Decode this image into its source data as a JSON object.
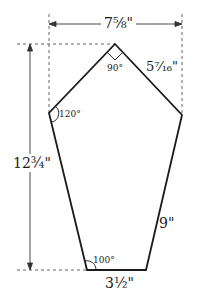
{
  "diagram": {
    "type": "pentagon-pattern",
    "colors": {
      "stroke": "#1a1a1a",
      "dim": "#333333",
      "background": "#ffffff"
    },
    "dimensions": {
      "width": "7⅝\"",
      "height": "12¾\""
    },
    "sides": {
      "top_right": "5⁷⁄₁₆\"",
      "right": "9\"",
      "bottom": "3½\""
    },
    "angles": {
      "top": "90°",
      "left": "120°",
      "bottom_left": "100°"
    }
  }
}
